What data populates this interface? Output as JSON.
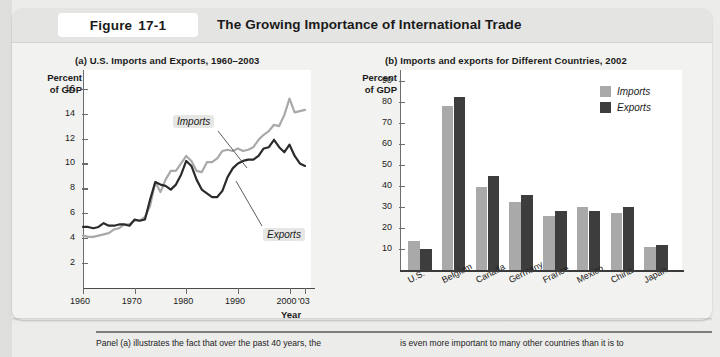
{
  "figure": {
    "tag_word": "Figure",
    "tag_number": "17-1",
    "title": "The Growing Importance of International Trade"
  },
  "panel_a": {
    "title": "(a) U.S. Imports and Exports, 1960–2003",
    "y_caption": "Percent\nof GDP",
    "x_caption": "Year",
    "series_labels": {
      "imports": "Imports",
      "exports": "Exports"
    }
  },
  "panel_b": {
    "title": "(b) Imports and exports for Different Countries, 2002",
    "y_caption": "Percent\nof GDP",
    "legend": [
      {
        "label": "Imports",
        "color": "#a9a9a9"
      },
      {
        "label": "Exports",
        "color": "#3d3d3d"
      }
    ]
  },
  "footer": {
    "left": "Panel (a) illustrates the fact that over the past 40 years, the",
    "right": "is even more important to many other countries than it is to"
  },
  "chart_data": [
    {
      "type": "line",
      "title": "(a) U.S. Imports and Exports, 1960–2003",
      "xlabel": "Year",
      "ylabel": "Percent of GDP",
      "xlim": [
        1960,
        2003
      ],
      "ylim": [
        0,
        17.5
      ],
      "yticks": [
        2,
        4,
        6,
        8,
        10,
        12,
        14,
        16
      ],
      "xticks": [
        1960,
        1970,
        1980,
        1990,
        2000,
        2003
      ],
      "xtick_labels": [
        "1960",
        "1970",
        "1980",
        "1990",
        "2000",
        "'03"
      ],
      "grid": false,
      "x": [
        1960,
        1961,
        1962,
        1963,
        1964,
        1965,
        1966,
        1967,
        1968,
        1969,
        1970,
        1971,
        1972,
        1973,
        1974,
        1975,
        1976,
        1977,
        1978,
        1979,
        1980,
        1981,
        1982,
        1983,
        1984,
        1985,
        1986,
        1987,
        1988,
        1989,
        1990,
        1991,
        1992,
        1993,
        1994,
        1995,
        1996,
        1997,
        1998,
        1999,
        2000,
        2001,
        2002,
        2003
      ],
      "series": [
        {
          "name": "Imports",
          "color": "#a9a9a9",
          "values": [
            4.2,
            4.1,
            4.1,
            4.2,
            4.3,
            4.4,
            4.7,
            4.8,
            5.1,
            5.1,
            5.4,
            5.4,
            5.7,
            6.6,
            8.5,
            7.7,
            8.7,
            9.4,
            9.4,
            10.0,
            10.6,
            10.2,
            9.4,
            9.3,
            10.1,
            10.1,
            10.4,
            11.0,
            11.1,
            11.0,
            11.2,
            11.0,
            11.1,
            11.3,
            11.9,
            12.3,
            12.6,
            13.1,
            13.0,
            13.9,
            15.2,
            14.1,
            14.2,
            14.3
          ]
        },
        {
          "name": "Exports",
          "color": "#2b2b2b",
          "values": [
            4.9,
            4.9,
            4.8,
            4.9,
            5.2,
            5.0,
            5.0,
            5.1,
            5.1,
            5.0,
            5.5,
            5.4,
            5.5,
            7.1,
            8.5,
            8.3,
            8.2,
            7.9,
            8.3,
            9.1,
            10.2,
            9.8,
            8.7,
            7.9,
            7.6,
            7.3,
            7.3,
            7.8,
            8.9,
            9.6,
            10.0,
            10.2,
            10.3,
            10.3,
            10.6,
            11.2,
            11.3,
            11.9,
            11.3,
            10.9,
            11.5,
            10.6,
            10.0,
            9.8
          ]
        }
      ]
    },
    {
      "type": "bar",
      "title": "(b) Imports and exports for Different Countries, 2002",
      "ylabel": "Percent of GDP",
      "ylim": [
        0,
        95
      ],
      "yticks": [
        10,
        20,
        30,
        40,
        50,
        60,
        70,
        80,
        90
      ],
      "grid": false,
      "legend_position": "top-right",
      "categories": [
        "U.S.",
        "Belgium",
        "Canada",
        "Germany",
        "France",
        "Mexico",
        "China",
        "Japan"
      ],
      "series": [
        {
          "name": "Imports",
          "color": "#a9a9a9",
          "values": [
            14,
            78,
            39.5,
            32.5,
            25.5,
            30,
            27,
            11
          ]
        },
        {
          "name": "Exports",
          "color": "#3d3d3d",
          "values": [
            10,
            82,
            44.5,
            35.5,
            28,
            28,
            30,
            12
          ]
        }
      ]
    }
  ]
}
